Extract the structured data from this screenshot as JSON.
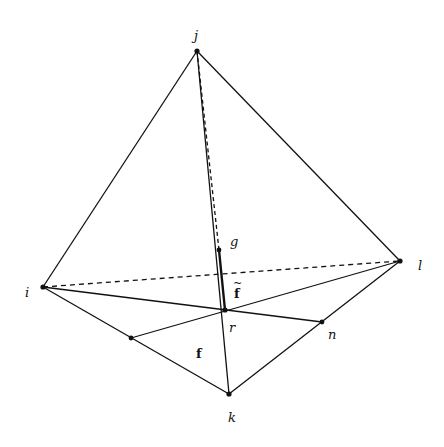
{
  "diagram": {
    "vertices": {
      "i": {
        "label": "i"
      },
      "j": {
        "label": "j"
      },
      "k": {
        "label": "k"
      },
      "l": {
        "label": "l"
      },
      "g": {
        "label": "g"
      },
      "r": {
        "label": "r"
      },
      "n": {
        "label": "n"
      },
      "m": {
        "label": ""
      }
    },
    "labels": {
      "f": "f",
      "f_tilde": "f",
      "tilde": "~"
    },
    "edges": [
      {
        "from": "i",
        "to": "j",
        "style": "solid"
      },
      {
        "from": "j",
        "to": "l",
        "style": "solid"
      },
      {
        "from": "i",
        "to": "k",
        "style": "solid"
      },
      {
        "from": "k",
        "to": "l",
        "style": "solid"
      },
      {
        "from": "i",
        "to": "l",
        "style": "dashed"
      },
      {
        "from": "j",
        "to": "k",
        "style": "solid"
      },
      {
        "from": "i",
        "to": "n",
        "style": "solid"
      },
      {
        "from": "m",
        "to": "l",
        "style": "solid"
      },
      {
        "from": "j",
        "to": "g",
        "style": "dashed"
      },
      {
        "from": "g",
        "to": "r",
        "style": "thick"
      }
    ]
  }
}
